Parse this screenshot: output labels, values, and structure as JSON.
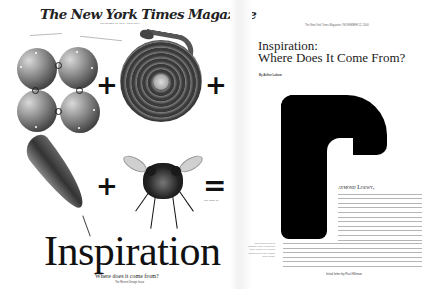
{
  "cover": {
    "masthead": "The New York Times Magazine",
    "date_line": "NOVEMBER 12, 2000 / SECTION 6",
    "equation_symbols": {
      "plus": "+",
      "equals": "="
    },
    "see_page": "See Page 77",
    "title": "Inspiration",
    "subtitle": "Where does it come from?",
    "byline": "The Recent Design Issue",
    "images": [
      "spheres-icon",
      "coiled-snake-icon",
      "feather-icon",
      "fly-icon"
    ]
  },
  "article": {
    "running_head": "The New York Times Magazine / NOVEMBER 12, 2000",
    "title_line1": "Inspiration:",
    "title_line2": "Where Does It Come From?",
    "byline": "By Arthur Lubow",
    "drop_cap": "r",
    "lede": "aymond Loewy,",
    "body_intro": "the industrial designer, once said that \"invention is the enabling factor in any new machine.\" Yet, in the spirit of good design, it begins with a radical simplification. Artists are influenced primarily by other artists, which means that mundane art forms can sound like a football breakdown of an animal part. Designers try to turn to Nature. And designers, by far, are among the producers of many designers...",
    "body_continued": "incoming between art and design could coordinate products on a modern rhythm. In our imaginations, revelations, the forced dawning of space and perspective in the Far gardens of Kyoto and the geometric sculptures of the dream space in Japan. At one time, he is rethinking of the way in which the icon is designed in a language of tangible signs that, through space, lighting and materials, make a connection past and now...",
    "sidebar_caption": "Raymond Loewy's designs, from a sculpted train engine to a pencil sharpener to the classic Coke bottle",
    "credit": "Initial letter by Paul Elliman"
  }
}
